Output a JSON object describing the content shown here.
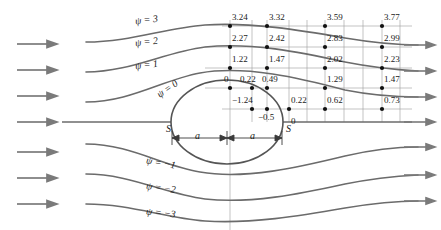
{
  "figure": {
    "colors": {
      "streamline": "#6b6b6b",
      "grid": "#9a9a9a",
      "body": "#555555",
      "text": "#1a1a1a",
      "arrow": "#7a7a7a",
      "point": "#111111",
      "background": "#ffffff"
    }
  },
  "chart_data": {
    "type": "line",
    "title": "",
    "xlabel": "",
    "ylabel": "",
    "grid": true,
    "legend_position": "inline",
    "streamline_labels": [
      {
        "name": "psi-3",
        "text": "ψ = 3"
      },
      {
        "name": "psi-2",
        "text": "ψ = 2"
      },
      {
        "name": "psi-1",
        "text": "ψ = 1"
      },
      {
        "name": "psi-0",
        "text": "ψ = 0"
      },
      {
        "name": "psi-m1",
        "text": "ψ = −1"
      },
      {
        "name": "psi-m2",
        "text": "ψ = −2"
      },
      {
        "name": "psi-m3",
        "text": "ψ = −3"
      }
    ],
    "stagnation_labels": [
      {
        "name": "stagnation-front",
        "text": "S"
      },
      {
        "name": "stagnation-rear",
        "text": "S"
      }
    ],
    "dimension_labels": [
      {
        "name": "half-spacing-left",
        "text": "a"
      },
      {
        "name": "half-spacing-right",
        "text": "a"
      }
    ],
    "node_rows": [
      {
        "row": 1,
        "values": [
          "3.24",
          "3.32",
          "3.59",
          "3.77"
        ]
      },
      {
        "row": 2,
        "values": [
          "2.27",
          "2.42",
          "2.83",
          "2.99"
        ]
      },
      {
        "row": 3,
        "values": [
          "1.22",
          "1.47",
          "2.02",
          "2.23"
        ]
      },
      {
        "row": 4,
        "values": [
          "0",
          "0.22",
          "0.49",
          "1.29",
          "1.47"
        ]
      },
      {
        "row": 5,
        "values": [
          "−1.24",
          "−0.5",
          "0.22",
          "0.62",
          "0.73"
        ]
      },
      {
        "row": 6,
        "values": [
          "0"
        ]
      }
    ],
    "nodes": [
      {
        "label": "3.24",
        "x": 230,
        "y": 26,
        "lx": 232,
        "ly": 13
      },
      {
        "label": "3.32",
        "x": 267,
        "y": 26,
        "lx": 269,
        "ly": 13
      },
      {
        "label": "3.59",
        "x": 325,
        "y": 26,
        "lx": 327,
        "ly": 13
      },
      {
        "label": "3.77",
        "x": 382,
        "y": 26,
        "lx": 384,
        "ly": 13
      },
      {
        "label": "2.27",
        "x": 230,
        "y": 47,
        "lx": 232,
        "ly": 34
      },
      {
        "label": "2.42",
        "x": 267,
        "y": 47,
        "lx": 269,
        "ly": 34
      },
      {
        "label": "2.83",
        "x": 325,
        "y": 47,
        "lx": 327,
        "ly": 34
      },
      {
        "label": "2.99",
        "x": 382,
        "y": 47,
        "lx": 384,
        "ly": 34
      },
      {
        "label": "1.22",
        "x": 230,
        "y": 68,
        "lx": 232,
        "ly": 55
      },
      {
        "label": "1.47",
        "x": 267,
        "y": 68,
        "lx": 269,
        "ly": 55
      },
      {
        "label": "2.02",
        "x": 325,
        "y": 68,
        "lx": 327,
        "ly": 55
      },
      {
        "label": "2.23",
        "x": 382,
        "y": 68,
        "lx": 384,
        "ly": 55
      },
      {
        "label": "0",
        "x": 230,
        "y": 88,
        "lx": 224,
        "ly": 75
      },
      {
        "label": "0.22",
        "x": 252,
        "y": 88,
        "lx": 240,
        "ly": 75
      },
      {
        "label": "0.49",
        "x": 267,
        "y": 88,
        "lx": 262,
        "ly": 75
      },
      {
        "label": "1.29",
        "x": 325,
        "y": 88,
        "lx": 327,
        "ly": 75
      },
      {
        "label": "1.47",
        "x": 382,
        "y": 88,
        "lx": 384,
        "ly": 75
      },
      {
        "label": "−1.24",
        "x": 252,
        "y": 109,
        "lx": 232,
        "ly": 96
      },
      {
        "label": "−0.5",
        "x": 267,
        "y": 109,
        "lx": 258,
        "ly": 113
      },
      {
        "label": "0.22",
        "x": 289,
        "y": 109,
        "lx": 291,
        "ly": 96
      },
      {
        "label": "0.62",
        "x": 325,
        "y": 109,
        "lx": 327,
        "ly": 96
      },
      {
        "label": "0.73",
        "x": 382,
        "y": 109,
        "lx": 384,
        "ly": 96
      },
      {
        "label": "0",
        "x": 0,
        "y": 0,
        "lx": 291,
        "ly": 117
      }
    ]
  }
}
